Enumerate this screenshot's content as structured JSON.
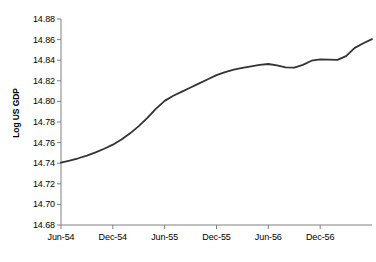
{
  "chart_data": {
    "type": "line",
    "title": "",
    "xlabel": "",
    "ylabel": "Log US GDP",
    "ylim": [
      14.68,
      14.88
    ],
    "ytick_labels": [
      "14.88",
      "14.86",
      "14.84",
      "14.82",
      "14.80",
      "14.78",
      "14.76",
      "14.74",
      "14.72",
      "14.70",
      "14.68"
    ],
    "ytick_values": [
      14.88,
      14.86,
      14.84,
      14.82,
      14.8,
      14.78,
      14.76,
      14.74,
      14.72,
      14.7,
      14.68
    ],
    "xtick_labels": [
      "Jun-54",
      "Dec-54",
      "Jun-55",
      "Dec-55",
      "Jun-56",
      "Dec-56"
    ],
    "xtick_values": [
      0,
      6,
      12,
      18,
      24,
      30
    ],
    "xlim": [
      0,
      36
    ],
    "grid": false,
    "legend": "none",
    "line_color": "#333333",
    "axis_color": "#808080",
    "series": [
      {
        "name": "Log US GDP",
        "x": [
          0,
          1,
          2,
          3,
          4,
          5,
          6,
          7,
          8,
          9,
          10,
          11,
          12,
          13,
          14,
          15,
          16,
          17,
          18,
          19,
          20,
          21,
          22,
          23,
          24,
          25,
          26,
          27,
          28,
          29,
          30,
          31,
          32,
          33,
          34,
          35,
          36
        ],
        "values": [
          14.7405,
          14.7425,
          14.7448,
          14.7474,
          14.7505,
          14.754,
          14.758,
          14.763,
          14.769,
          14.776,
          14.784,
          14.793,
          14.8005,
          14.8055,
          14.8095,
          14.8135,
          14.8175,
          14.8215,
          14.8255,
          14.8285,
          14.8308,
          14.8325,
          14.834,
          14.8355,
          14.8363,
          14.835,
          14.833,
          14.8327,
          14.8355,
          14.8395,
          14.8408,
          14.8405,
          14.8403,
          14.844,
          14.852,
          14.8565,
          14.8605
        ]
      }
    ]
  },
  "axis": {
    "y_title": "Log US GDP"
  }
}
